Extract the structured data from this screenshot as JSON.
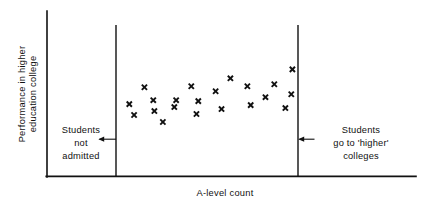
{
  "chart_data": {
    "type": "scatter",
    "title": "",
    "xlabel": "A-level count",
    "ylabel": "Performance in higher education college",
    "ylabel_line1": "Performance in higher",
    "ylabel_line2": "education college",
    "grid": false,
    "legend": null,
    "axis_ticks": {
      "x": [],
      "y": []
    },
    "xlim": [
      0,
      100
    ],
    "ylim": [
      0,
      100
    ],
    "points": [
      {
        "x": 22.3,
        "y": 43.7
      },
      {
        "x": 23.6,
        "y": 37.1
      },
      {
        "x": 26.4,
        "y": 53.9
      },
      {
        "x": 28.8,
        "y": 46.1
      },
      {
        "x": 29.1,
        "y": 39.5
      },
      {
        "x": 31.4,
        "y": 32.9
      },
      {
        "x": 35.0,
        "y": 46.1
      },
      {
        "x": 34.5,
        "y": 41.9
      },
      {
        "x": 39.1,
        "y": 54.5
      },
      {
        "x": 41.0,
        "y": 45.5
      },
      {
        "x": 40.5,
        "y": 37.7
      },
      {
        "x": 45.7,
        "y": 51.5
      },
      {
        "x": 47.3,
        "y": 40.7
      },
      {
        "x": 49.7,
        "y": 59.3
      },
      {
        "x": 54.3,
        "y": 54.5
      },
      {
        "x": 55.2,
        "y": 43.1
      },
      {
        "x": 59.2,
        "y": 47.9
      },
      {
        "x": 61.6,
        "y": 55.7
      },
      {
        "x": 64.6,
        "y": 41.3
      },
      {
        "x": 66.2,
        "y": 49.7
      },
      {
        "x": 66.5,
        "y": 64.7
      }
    ],
    "regions": [
      {
        "name": "left-region",
        "boundary_x": 18.7,
        "annotation_lines": [
          "Students",
          "not",
          "admitted"
        ],
        "arrow_direction": "left"
      },
      {
        "name": "right-region",
        "boundary_x": 68.2,
        "annotation_lines": [
          "Students",
          "go to 'higher'",
          "colleges"
        ],
        "arrow_direction": "left"
      }
    ],
    "colors": {
      "marker": "#111111",
      "axis": "#111111",
      "divider": "#111111",
      "background": "#ffffff"
    }
  },
  "annotations": {
    "left": {
      "line1": "Students",
      "line2": "not",
      "line3": "admitted"
    },
    "right": {
      "line1": "Students",
      "line2": "go to 'higher'",
      "line3": "colleges"
    }
  },
  "axes": {
    "x_label": "A-level count",
    "y_label_line1": "Performance in higher",
    "y_label_line2": "education college"
  }
}
